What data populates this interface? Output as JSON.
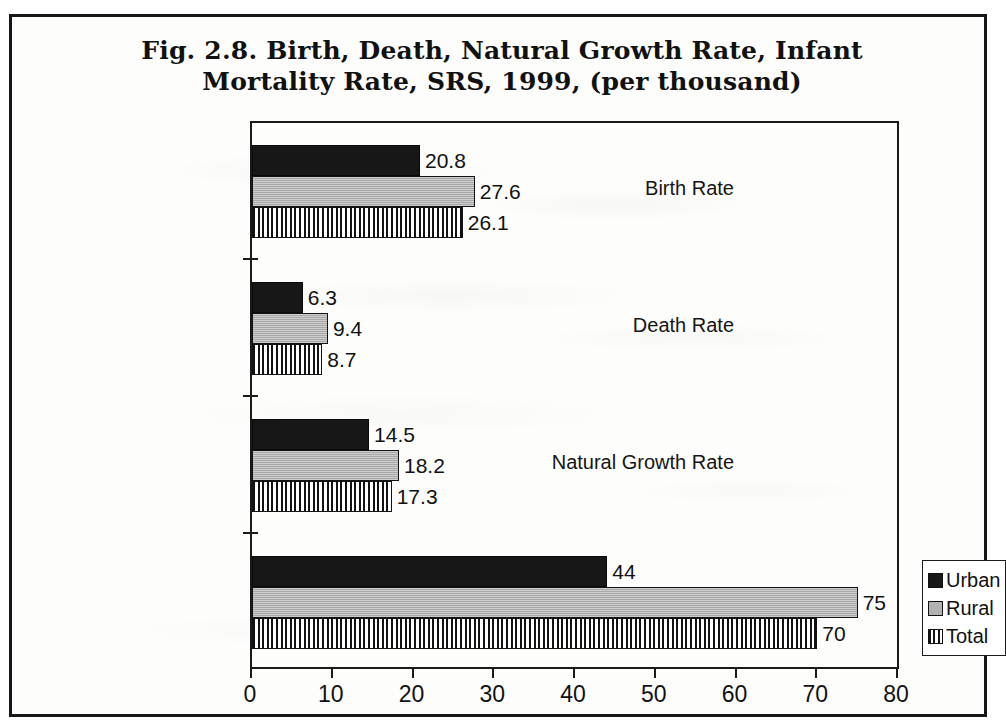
{
  "figure": {
    "title_line1": "Fig. 2.8. Birth, Death, Natural Growth  Rate, Infant",
    "title_line2": "Mortality Rate,  SRS, 1999, (per thousand)"
  },
  "legend": {
    "items": [
      {
        "label": "Urban",
        "swatch": "solid-black-swatch-icon",
        "color": "#171717"
      },
      {
        "label": "Rural",
        "swatch": "solid-gray-swatch-icon",
        "color": "#b2b2b2"
      },
      {
        "label": "Total",
        "swatch": "vertical-stripe-swatch-icon",
        "color": "#ffffff"
      }
    ]
  },
  "chart_data": {
    "type": "bar",
    "orientation": "horizontal",
    "title": "Fig. 2.8. Birth, Death, Natural Growth  Rate, Infant Mortality Rate,  SRS, 1999, (per thousand)",
    "xlabel": "",
    "ylabel": "",
    "xlim": [
      0,
      80
    ],
    "xticks": [
      0,
      10,
      20,
      30,
      40,
      50,
      60,
      70,
      80
    ],
    "xtick_labels": [
      "0",
      "10",
      "20",
      "30",
      "40",
      "50",
      "60",
      "70",
      "80"
    ],
    "grid": false,
    "legend_position": "right",
    "categories": [
      "Birth Rate",
      "Death Rate",
      "Natural Growth Rate",
      "Infant Mortality Rate"
    ],
    "series": [
      {
        "name": "Urban",
        "values": [
          20.8,
          6.3,
          14.5,
          44
        ]
      },
      {
        "name": "Rural",
        "values": [
          27.6,
          9.4,
          18.2,
          75
        ]
      },
      {
        "name": "Total",
        "values": [
          26.1,
          8.7,
          17.3,
          70
        ]
      }
    ],
    "value_labels": {
      "Birth Rate": {
        "Urban": "20.8",
        "Rural": "27.6",
        "Total": "26.1"
      },
      "Death Rate": {
        "Urban": "6.3",
        "Rural": "9.4",
        "Total": "8.7"
      },
      "Natural Growth Rate": {
        "Urban": "14.5",
        "Rural": "18.2",
        "Total": "17.3"
      },
      "Infant Mortality Rate": {
        "Urban": "44",
        "Rural": "75",
        "Total": "70"
      }
    }
  }
}
